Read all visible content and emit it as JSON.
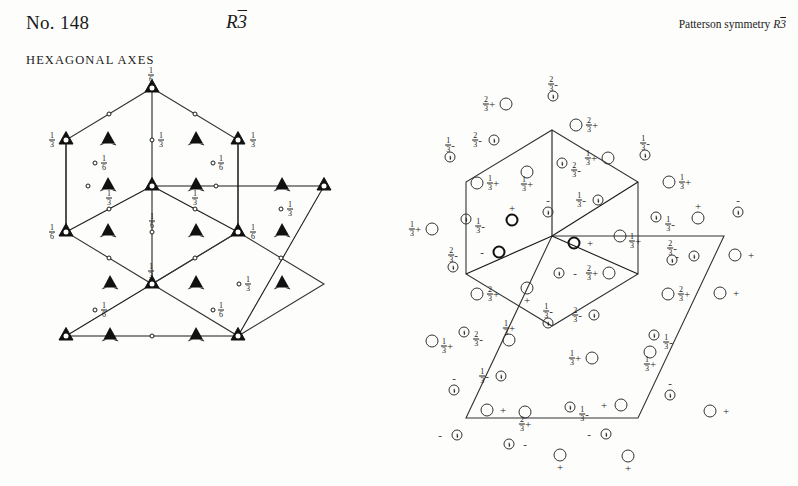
{
  "header": {
    "number_label": "No. 148",
    "hm_symbol": "R3",
    "hm_symbol_bar": "3",
    "patterson_prefix": "Patterson symmetry",
    "patterson_letter": "R",
    "patterson_bar": "3",
    "axes_label": "HEXAGONAL AXES"
  },
  "colors": {
    "ink": "#1a1a1a",
    "line": "#333333",
    "page": "#fdfdfc"
  },
  "symmetry_diagram": {
    "name": "symmetry-element-diagram",
    "caption": "HEXAGONAL AXES",
    "cell_outline_points": "152,88 238,140 238,232 152,284 66,232 66,140",
    "lower_cell_points": "152,284 238,232 324,284 238,336",
    "symbols": {
      "triangle_open_meaning": "3bar-axis",
      "triangle_filled_meaning": "3-axis",
      "small_circle_meaning": "inversion-centre"
    },
    "axes_3bar": [
      {
        "x": 152,
        "y": 88,
        "label": "1/6",
        "side": "top"
      },
      {
        "x": 66,
        "y": 140,
        "label": "1/3",
        "side": "left"
      },
      {
        "x": 238,
        "y": 140,
        "label": "1/3",
        "side": "right"
      },
      {
        "x": 152,
        "y": 186,
        "label": "",
        "side": "none"
      },
      {
        "x": 66,
        "y": 232,
        "label": "1/6",
        "side": "left"
      },
      {
        "x": 238,
        "y": 232,
        "label": "1/6",
        "side": "right"
      },
      {
        "x": 324,
        "y": 186,
        "label": "",
        "side": "none"
      },
      {
        "x": 152,
        "y": 284,
        "label": "1/3",
        "side": "top"
      },
      {
        "x": 238,
        "y": 336,
        "label": "",
        "side": "none"
      },
      {
        "x": 66,
        "y": 336,
        "label": "",
        "side": "none"
      }
    ],
    "axes_3": [
      {
        "x": 108,
        "y": 140
      },
      {
        "x": 196,
        "y": 140
      },
      {
        "x": 108,
        "y": 186
      },
      {
        "x": 196,
        "y": 186
      },
      {
        "x": 282,
        "y": 186
      },
      {
        "x": 108,
        "y": 232
      },
      {
        "x": 196,
        "y": 232
      },
      {
        "x": 282,
        "y": 232
      },
      {
        "x": 110,
        "y": 284
      },
      {
        "x": 196,
        "y": 284
      },
      {
        "x": 282,
        "y": 284
      },
      {
        "x": 110,
        "y": 336
      },
      {
        "x": 196,
        "y": 336
      }
    ],
    "inversion_centres": [
      {
        "x": 109,
        "y": 114
      },
      {
        "x": 195,
        "y": 114
      },
      {
        "x": 152,
        "y": 140,
        "label": "1/3",
        "side": "right"
      },
      {
        "x": 88,
        "y": 186
      },
      {
        "x": 216,
        "y": 186
      },
      {
        "x": 95,
        "y": 163,
        "label": "1/6",
        "side": "right_of_label"
      },
      {
        "x": 213,
        "y": 163,
        "label": "1/6",
        "side": "left_of_label"
      },
      {
        "x": 109,
        "y": 209,
        "label": "1/3",
        "side": "top"
      },
      {
        "x": 195,
        "y": 209,
        "label": "1/3",
        "side": "top"
      },
      {
        "x": 152,
        "y": 232,
        "label": "1/6",
        "side": "top"
      },
      {
        "x": 281,
        "y": 209,
        "label": "1/3",
        "side": "right_of_label"
      },
      {
        "x": 109,
        "y": 258
      },
      {
        "x": 195,
        "y": 258
      },
      {
        "x": 239,
        "y": 284,
        "label": "1/3",
        "side": "right_of_label"
      },
      {
        "x": 95,
        "y": 310,
        "label": "1/6",
        "side": "right_of_label"
      },
      {
        "x": 213,
        "y": 310,
        "label": "1/6",
        "side": "left_of_label"
      },
      {
        "x": 281,
        "y": 258
      },
      {
        "x": 152,
        "y": 336
      }
    ]
  },
  "general_positions_diagram": {
    "name": "general-position-diagram",
    "hexagon_points": "552,130 638,182 638,274 552,326 466,274 466,182",
    "parallelogram_points": "552,236 724,236 638,418 466,418",
    "symbols": {
      "open_circle_meaning": "general position, z positive",
      "comma_circle_meaning": "position related by inversion (enantiomorph)",
      "plus_meaning": "+z",
      "minus_meaning": "-z"
    },
    "points": [
      {
        "x": 506,
        "y": 104,
        "type": "open",
        "label": "2/3",
        "sign": "+",
        "lp": "left"
      },
      {
        "x": 553,
        "y": 96,
        "type": "comma",
        "label": "2/3",
        "sign": "-",
        "lp": "above"
      },
      {
        "x": 576,
        "y": 125,
        "type": "open",
        "label": "2/3",
        "sign": "+",
        "lp": "right"
      },
      {
        "x": 450,
        "y": 157,
        "type": "comma",
        "label": "1/3",
        "sign": "-",
        "lp": "above"
      },
      {
        "x": 494,
        "y": 140,
        "type": "comma",
        "label": "2/3",
        "sign": "-",
        "lp": "left"
      },
      {
        "x": 562,
        "y": 163,
        "type": "comma",
        "label": "2/3",
        "sign": "-",
        "lp": "rightbelow"
      },
      {
        "x": 608,
        "y": 158,
        "type": "open",
        "label": "1/3",
        "sign": "+",
        "lp": "left"
      },
      {
        "x": 645,
        "y": 155,
        "type": "comma",
        "label": "1/3",
        "sign": "-",
        "lp": "above"
      },
      {
        "x": 477,
        "y": 183,
        "type": "open",
        "label": "1/3",
        "sign": "+",
        "lp": "right"
      },
      {
        "x": 527,
        "y": 172,
        "type": "open",
        "label": "1/3",
        "sign": "+",
        "lp": "below"
      },
      {
        "x": 669,
        "y": 182,
        "type": "open",
        "label": "1/3",
        "sign": "+",
        "lp": "right"
      },
      {
        "x": 548,
        "y": 212,
        "type": "comma",
        "label": "",
        "sign": "-",
        "lp": "above"
      },
      {
        "x": 598,
        "y": 200,
        "type": "comma",
        "label": "1/3",
        "sign": "-",
        "lp": "left"
      },
      {
        "x": 466,
        "y": 219,
        "type": "comma",
        "label": "1/3",
        "sign": "-",
        "lp": "rightbelow"
      },
      {
        "x": 512,
        "y": 220,
        "type": "bold",
        "label": "",
        "sign": "+",
        "lp": "above"
      },
      {
        "x": 656,
        "y": 217,
        "type": "comma",
        "label": "1/3",
        "sign": "-",
        "lp": "rightbelow"
      },
      {
        "x": 698,
        "y": 218,
        "type": "open",
        "label": "",
        "sign": "+",
        "lp": "above"
      },
      {
        "x": 738,
        "y": 212,
        "type": "comma",
        "label": "",
        "sign": "-",
        "lp": "above"
      },
      {
        "x": 432,
        "y": 229,
        "type": "open",
        "label": "1/3",
        "sign": "+",
        "lp": "left"
      },
      {
        "x": 574,
        "y": 243,
        "type": "bold",
        "label": "",
        "sign": "+",
        "lp": "right"
      },
      {
        "x": 620,
        "y": 236,
        "type": "open",
        "label": "1/3",
        "sign": "+",
        "lp": "leftbelow"
      },
      {
        "x": 453,
        "y": 267,
        "type": "comma",
        "label": "2/3",
        "sign": "-",
        "lp": "above"
      },
      {
        "x": 499,
        "y": 252,
        "type": "bold",
        "label": "",
        "sign": "-",
        "lp": "left"
      },
      {
        "x": 672,
        "y": 260,
        "type": "comma",
        "label": "2/3",
        "sign": "-",
        "lp": "above"
      },
      {
        "x": 694,
        "y": 256,
        "type": "comma",
        "label": "",
        "sign": "-",
        "lp": "left"
      },
      {
        "x": 735,
        "y": 255,
        "type": "open",
        "label": "",
        "sign": "+",
        "lp": "right"
      },
      {
        "x": 559,
        "y": 273,
        "type": "comma",
        "label": "",
        "sign": "-",
        "lp": "right"
      },
      {
        "x": 609,
        "y": 273,
        "type": "open",
        "label": "2/3",
        "sign": "+",
        "lp": "left"
      },
      {
        "x": 477,
        "y": 294,
        "type": "open",
        "label": "2/3",
        "sign": "+",
        "lp": "right"
      },
      {
        "x": 527,
        "y": 288,
        "type": "open",
        "label": "",
        "sign": "+",
        "lp": "below"
      },
      {
        "x": 668,
        "y": 294,
        "type": "open",
        "label": "2/3",
        "sign": "+",
        "lp": "right"
      },
      {
        "x": 720,
        "y": 293,
        "type": "open",
        "label": "",
        "sign": "+",
        "lp": "right"
      },
      {
        "x": 548,
        "y": 323,
        "type": "comma",
        "label": "1/3",
        "sign": "-",
        "lp": "above"
      },
      {
        "x": 594,
        "y": 315,
        "type": "comma",
        "label": "2/3",
        "sign": "-",
        "lp": "left"
      },
      {
        "x": 464,
        "y": 332,
        "type": "comma",
        "label": "2/3",
        "sign": "-",
        "lp": "rightbelow"
      },
      {
        "x": 509,
        "y": 340,
        "type": "open",
        "label": "1/3",
        "sign": "+",
        "lp": "above"
      },
      {
        "x": 654,
        "y": 335,
        "type": "comma",
        "label": "1/3",
        "sign": "-",
        "lp": "rightbelow"
      },
      {
        "x": 432,
        "y": 341,
        "type": "open",
        "label": "1/3",
        "sign": "+",
        "lp": "leftbelow"
      },
      {
        "x": 592,
        "y": 358,
        "type": "open",
        "label": "1/3",
        "sign": "+",
        "lp": "left"
      },
      {
        "x": 650,
        "y": 352,
        "type": "open",
        "label": "1/3",
        "sign": "+",
        "lp": "below"
      },
      {
        "x": 501,
        "y": 376,
        "type": "comma",
        "label": "1/3",
        "sign": "-",
        "lp": "left"
      },
      {
        "x": 454,
        "y": 390,
        "type": "comma",
        "label": "",
        "sign": "-",
        "lp": "above"
      },
      {
        "x": 670,
        "y": 395,
        "type": "comma",
        "label": "",
        "sign": "-",
        "lp": "above"
      },
      {
        "x": 570,
        "y": 407,
        "type": "comma",
        "label": "1/3",
        "sign": "-",
        "lp": "rightbelow"
      },
      {
        "x": 621,
        "y": 405,
        "type": "open",
        "label": "",
        "sign": "+",
        "lp": "left"
      },
      {
        "x": 487,
        "y": 410,
        "type": "open",
        "label": "",
        "sign": "+",
        "lp": "right"
      },
      {
        "x": 525,
        "y": 412,
        "type": "open",
        "label": "2/3",
        "sign": "+",
        "lp": "below"
      },
      {
        "x": 710,
        "y": 411,
        "type": "open",
        "label": "",
        "sign": "+",
        "lp": "right"
      },
      {
        "x": 606,
        "y": 434,
        "type": "comma",
        "label": "",
        "sign": "-",
        "lp": "left"
      },
      {
        "x": 457,
        "y": 435,
        "type": "comma",
        "label": "",
        "sign": "-",
        "lp": "left"
      },
      {
        "x": 509,
        "y": 444,
        "type": "comma",
        "label": "",
        "sign": "-",
        "lp": "right"
      },
      {
        "x": 560,
        "y": 455,
        "type": "open",
        "label": "",
        "sign": "+",
        "lp": "below"
      },
      {
        "x": 628,
        "y": 456,
        "type": "open",
        "label": "",
        "sign": "+",
        "lp": "below"
      }
    ]
  }
}
